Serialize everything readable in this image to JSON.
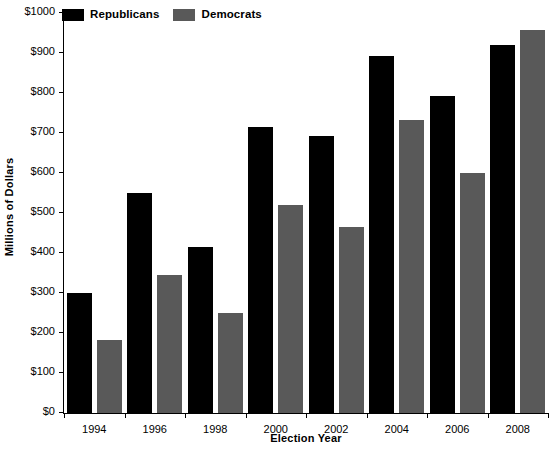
{
  "chart_data": {
    "type": "bar",
    "title": "",
    "xlabel": "Election Year",
    "ylabel": "Millions of Dollars",
    "categories": [
      "1994",
      "1996",
      "1998",
      "2000",
      "2002",
      "2004",
      "2006",
      "2008"
    ],
    "series": [
      {
        "name": "Republicans",
        "color": "#000000",
        "values": [
          300,
          550,
          415,
          715,
          692,
          893,
          793,
          920
        ]
      },
      {
        "name": "Democrats",
        "color": "#595959",
        "values": [
          183,
          345,
          250,
          520,
          465,
          733,
          600,
          958
        ]
      }
    ],
    "ylim": [
      0,
      1000
    ],
    "ytick_values": [
      0,
      100,
      200,
      300,
      400,
      500,
      600,
      700,
      800,
      900,
      1000
    ],
    "ytick_labels": [
      "$0",
      "$100",
      "$200",
      "$300",
      "$400",
      "$500",
      "$600",
      "$700",
      "$800",
      "$900",
      "$1000"
    ],
    "grid": false,
    "legend_position": "top-left"
  }
}
